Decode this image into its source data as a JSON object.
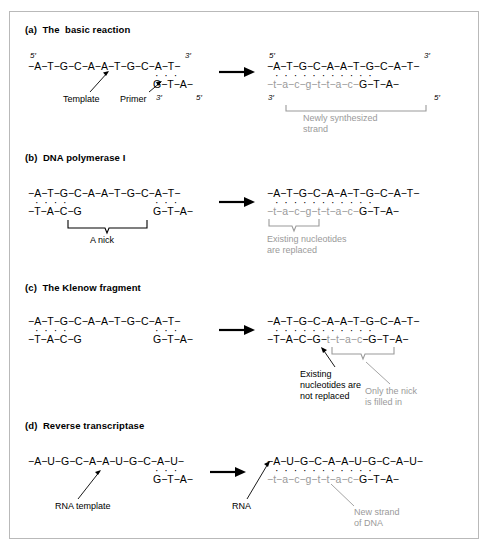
{
  "figure": {
    "background": "#ffffff",
    "border_color": "#b9b9b9",
    "ink_color": "#000000",
    "gray_color": "#9a9a9a"
  },
  "panels": [
    {
      "id": "a",
      "title": "(a)  The  basic reaction",
      "left": {
        "top_strand": "−A−T−G−C−A−A−T−G−C−A−T−",
        "top_left_end": "5′",
        "top_right_end": "3′",
        "pair_dots": "·  ·  ·",
        "bottom_strand": "G−T−A−",
        "bottom_left_end": "3′",
        "bottom_right_end": "5′",
        "callout_template": "Template",
        "callout_primer": "Primer"
      },
      "right": {
        "top_strand": "−A−T−G−C−A−A−T−G−C−A−T−",
        "top_left_end": "5′",
        "top_right_end": "3′",
        "pair_dots": "·  ·  ·  ·  ·  ·  ·  ·  ·  ·  ·",
        "bottom_new": "−t−a−c−g−t−t−a−c−",
        "bottom_old": "G−T−A−",
        "bottom_left_end": "3′",
        "bottom_right_end": "5′",
        "bracket_label": "Newly synthesized\nstrand"
      }
    },
    {
      "id": "b",
      "title": "(b)  DNA polymerase I",
      "left": {
        "top_strand": "−A−T−G−C−A−A−T−G−C−A−T−",
        "dots_left": "·  ·  ·  ·",
        "dots_right": "·  ·  ·",
        "bottom_left": "−T−A−C−G",
        "bottom_right": "G−T−A−",
        "bracket_label": "A nick"
      },
      "right": {
        "top_strand": "−A−T−G−C−A−A−T−G−C−A−T−",
        "pair_dots": "·  ·  ·  ·  ·  ·  ·  ·  ·  ·  ·",
        "bottom_new": "−t−a−c−g−t−t−a−c−",
        "bottom_old": "G−T−A−",
        "bracket_label": "Existing nucleotides\nare replaced"
      }
    },
    {
      "id": "c",
      "title": "(c)  The Klenow fragment",
      "left": {
        "top_strand": "−A−T−G−C−A−A−T−G−C−A−T−",
        "dots_left": "·  ·  ·  ·",
        "dots_right": "·  ·  ·",
        "bottom_left": "−T−A−C−G",
        "bottom_right": "G−T−A−"
      },
      "right": {
        "top_strand": "−A−T−G−C−A−A−T−G−C−A−T−",
        "pair_dots": "·  ·  ·  ·  ·  ·  ·  ·  ·  ·  ·",
        "bottom_old_left": "−T−A−C−G−",
        "bottom_new": "t−t−a−c",
        "bottom_old_right": "−G−T−A−",
        "callout_existing": "Existing\nnucleotides are\nnot replaced",
        "callout_nick": "Only the nick\nis filled in"
      }
    },
    {
      "id": "d",
      "title": "(d)  Reverse transcriptase",
      "left": {
        "top_strand": "−A−U−G−C−A−A−U−G−C−A−U−",
        "pair_dots": "·  ·  ·",
        "bottom_strand": "G−T−A−",
        "callout_template": "RNA template"
      },
      "right": {
        "top_strand": "−A−U−G−C−A−A−U−G−C−A−U−",
        "pair_dots": "·  ·  ·  ·  ·  ·  ·  ·  ·  ·  ·",
        "bottom_new": "−t−a−c−g−t−t−a−c−",
        "bottom_old": "G−T−A−",
        "callout_rna": "RNA",
        "callout_new_strand": "New strand\nof DNA"
      }
    }
  ]
}
